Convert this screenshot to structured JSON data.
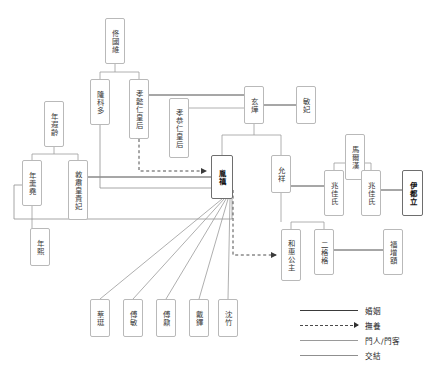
{
  "diagram": {
    "title": "",
    "type": "genealogy-relationship-chart",
    "colors": {
      "node_border": "#b9b9b9",
      "node_border_emphasis": "#6e6e6e",
      "edge_marriage": "#3a3a3a",
      "edge_foster": "#4a4a4a",
      "edge_retainer": "#9a9a9a",
      "edge_association": "#8f8f8f",
      "background": "#ffffff"
    },
    "nodes": [
      {
        "id": "tong_guowei",
        "label": "佟國維",
        "x": 105,
        "y": 18,
        "w": 20,
        "h": 46,
        "emphasis": false
      },
      {
        "id": "longkeduo",
        "label": "隆科多",
        "x": 90,
        "y": 79,
        "w": 20,
        "h": 46,
        "emphasis": false
      },
      {
        "id": "xiaoyiren",
        "label": "孝懿仁皇后",
        "x": 129,
        "y": 79,
        "w": 20,
        "h": 60,
        "emphasis": false
      },
      {
        "id": "xiaogongren",
        "label": "孝恭仁皇后",
        "x": 169,
        "y": 98,
        "w": 20,
        "h": 60,
        "emphasis": false
      },
      {
        "id": "xuanye",
        "label": "玄燁",
        "x": 244,
        "y": 86,
        "w": 20,
        "h": 38,
        "emphasis": false
      },
      {
        "id": "minfei",
        "label": "敏妃",
        "x": 296,
        "y": 86,
        "w": 20,
        "h": 38,
        "emphasis": false
      },
      {
        "id": "nian_xialing",
        "label": "年遐齡",
        "x": 44,
        "y": 101,
        "w": 20,
        "h": 46,
        "emphasis": false
      },
      {
        "id": "maerhan",
        "label": "馬爾漢",
        "x": 345,
        "y": 134,
        "w": 20,
        "h": 46,
        "emphasis": false
      },
      {
        "id": "nian_gengyao",
        "label": "年羹堯",
        "x": 22,
        "y": 160,
        "w": 20,
        "h": 46,
        "emphasis": false
      },
      {
        "id": "dunsu",
        "label": "敦肅皇貴妃",
        "x": 68,
        "y": 160,
        "w": 20,
        "h": 60,
        "emphasis": false
      },
      {
        "id": "yinzhen",
        "label": "胤禛",
        "x": 211,
        "y": 155,
        "w": 22,
        "h": 44,
        "emphasis": true
      },
      {
        "id": "yunxiang",
        "label": "允祥",
        "x": 271,
        "y": 155,
        "w": 20,
        "h": 38,
        "emphasis": false
      },
      {
        "id": "zhaojia1",
        "label": "兆佳氏",
        "x": 324,
        "y": 170,
        "w": 20,
        "h": 46,
        "emphasis": false
      },
      {
        "id": "zhaojia2",
        "label": "兆佳氏",
        "x": 361,
        "y": 170,
        "w": 20,
        "h": 46,
        "emphasis": false
      },
      {
        "id": "yiduli",
        "label": "伊都立",
        "x": 402,
        "y": 170,
        "w": 21,
        "h": 46,
        "emphasis": true
      },
      {
        "id": "hehui",
        "label": "和惠公主",
        "x": 281,
        "y": 229,
        "w": 20,
        "h": 52,
        "emphasis": false
      },
      {
        "id": "erge",
        "label": "二格格",
        "x": 314,
        "y": 229,
        "w": 20,
        "h": 46,
        "emphasis": false
      },
      {
        "id": "fuzenge",
        "label": "福增額",
        "x": 383,
        "y": 229,
        "w": 20,
        "h": 46,
        "emphasis": false
      },
      {
        "id": "nian_xi",
        "label": "年熙",
        "x": 30,
        "y": 228,
        "w": 20,
        "h": 38,
        "emphasis": false
      },
      {
        "id": "caiting",
        "label": "蔡珽",
        "x": 90,
        "y": 299,
        "w": 20,
        "h": 38,
        "emphasis": false
      },
      {
        "id": "fumin",
        "label": "傅敏",
        "x": 123,
        "y": 299,
        "w": 20,
        "h": 38,
        "emphasis": false
      },
      {
        "id": "funai",
        "label": "傅鼐",
        "x": 156,
        "y": 299,
        "w": 20,
        "h": 38,
        "emphasis": false
      },
      {
        "id": "daiduo",
        "label": "戴鐸",
        "x": 189,
        "y": 299,
        "w": 20,
        "h": 38,
        "emphasis": false
      },
      {
        "id": "shenzhu",
        "label": "沈竹",
        "x": 218,
        "y": 299,
        "w": 20,
        "h": 38,
        "emphasis": false
      }
    ],
    "legend": {
      "items": [
        {
          "id": "marriage",
          "label": "婚姻",
          "style": "solid",
          "color": "#3a3a3a",
          "arrow": false
        },
        {
          "id": "foster",
          "label": "撫養",
          "style": "dashed",
          "color": "#4a4a4a",
          "arrow": true
        },
        {
          "id": "retainer",
          "label": "門人/門客",
          "style": "solid",
          "color": "#9a9a9a",
          "arrow": false
        },
        {
          "id": "association",
          "label": "交結",
          "style": "solid",
          "color": "#8f8f8f",
          "arrow": false
        }
      ]
    },
    "relations": [
      {
        "from": "tong_guowei",
        "to": "longkeduo",
        "type": "kinship"
      },
      {
        "from": "tong_guowei",
        "to": "xiaoyiren",
        "type": "kinship"
      },
      {
        "from": "xiaoyiren",
        "to": "xuanye",
        "type": "marriage"
      },
      {
        "from": "xiaogongren",
        "to": "xuanye",
        "type": "marriage"
      },
      {
        "from": "xuanye",
        "to": "minfei",
        "type": "marriage"
      },
      {
        "from": "xuanye",
        "to": "yinzhen",
        "type": "kinship"
      },
      {
        "from": "xuanye",
        "to": "yunxiang",
        "type": "kinship"
      },
      {
        "from": "xiaoyiren",
        "to": "yinzhen",
        "type": "foster"
      },
      {
        "from": "nian_xialing",
        "to": "nian_gengyao",
        "type": "kinship"
      },
      {
        "from": "nian_xialing",
        "to": "dunsu",
        "type": "kinship"
      },
      {
        "from": "dunsu",
        "to": "yinzhen",
        "type": "marriage"
      },
      {
        "from": "longkeduo",
        "to": "yinzhen",
        "type": "association"
      },
      {
        "from": "nian_gengyao",
        "to": "yinzhen",
        "type": "association"
      },
      {
        "from": "nian_gengyao",
        "to": "nian_xi",
        "type": "kinship"
      },
      {
        "from": "maerhan",
        "to": "zhaojia1",
        "type": "kinship"
      },
      {
        "from": "maerhan",
        "to": "zhaojia2",
        "type": "kinship"
      },
      {
        "from": "zhaojia1",
        "to": "yunxiang",
        "type": "marriage"
      },
      {
        "from": "zhaojia2",
        "to": "yiduli",
        "type": "marriage"
      },
      {
        "from": "yunxiang",
        "to": "hehui",
        "type": "kinship"
      },
      {
        "from": "yunxiang",
        "to": "erge",
        "type": "kinship"
      },
      {
        "from": "yinzhen",
        "to": "hehui",
        "type": "foster"
      },
      {
        "from": "erge",
        "to": "fuzenge",
        "type": "marriage"
      },
      {
        "from": "yinzhen",
        "to": "caiting",
        "type": "retainer"
      },
      {
        "from": "yinzhen",
        "to": "fumin",
        "type": "retainer"
      },
      {
        "from": "yinzhen",
        "to": "funai",
        "type": "retainer"
      },
      {
        "from": "yinzhen",
        "to": "daiduo",
        "type": "retainer"
      },
      {
        "from": "yinzhen",
        "to": "shenzhu",
        "type": "retainer"
      }
    ]
  }
}
